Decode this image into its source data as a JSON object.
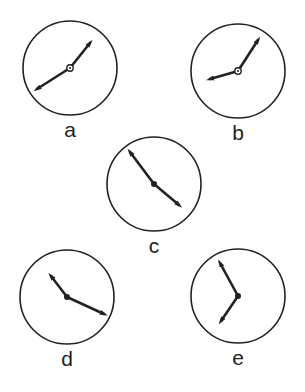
{
  "figure": {
    "stroke_color": "#222222",
    "background": "#ffffff"
  },
  "clocks": [
    {
      "label": "a",
      "cx": 70,
      "cy": 68,
      "r": 47,
      "hand1": {
        "x": 90,
        "y": 43
      },
      "hand2": {
        "x": 37,
        "y": 89
      },
      "hub": "ring"
    },
    {
      "label": "b",
      "cx": 238,
      "cy": 71,
      "r": 47,
      "hand1": {
        "x": 258,
        "y": 40
      },
      "hand2": {
        "x": 210,
        "y": 79
      },
      "hub": "ring"
    },
    {
      "label": "c",
      "cx": 154,
      "cy": 184,
      "r": 47,
      "hand1": {
        "x": 130,
        "y": 152
      },
      "hand2": {
        "x": 179,
        "y": 205
      },
      "hub": "dot"
    },
    {
      "label": "d",
      "cx": 67,
      "cy": 297,
      "r": 47,
      "hand1": {
        "x": 51,
        "y": 276
      },
      "hand2": {
        "x": 104,
        "y": 314
      },
      "hub": "dot"
    },
    {
      "label": "e",
      "cx": 238,
      "cy": 296,
      "r": 47,
      "hand1": {
        "x": 220,
        "y": 263
      },
      "hand2": {
        "x": 221,
        "y": 321
      },
      "hub": "dot"
    }
  ]
}
